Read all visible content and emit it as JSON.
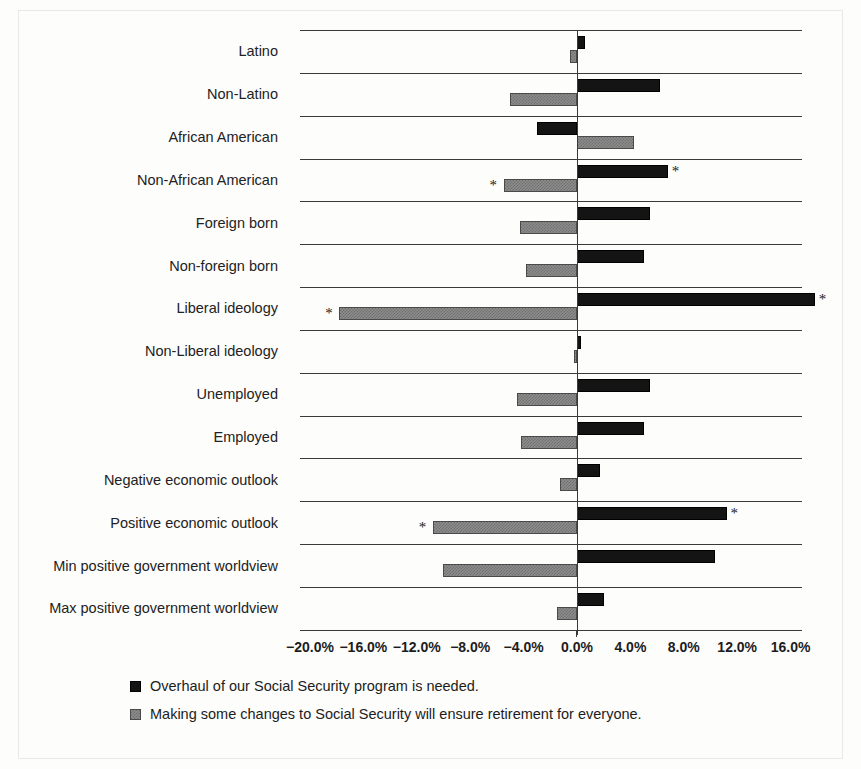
{
  "chart_data": {
    "type": "bar",
    "orientation": "horizontal",
    "title": "",
    "xlabel": "",
    "ylabel": "",
    "xlim": [
      -20.8,
      16.8
    ],
    "grid": true,
    "legend_position": "bottom-left",
    "xticks": [
      "−20.0%",
      "−16.0%",
      "−12.0%",
      "−8.0%",
      "−4.0%",
      "0.0%",
      "4.0%",
      "8.0%",
      "12.0%",
      "16.0%"
    ],
    "xtick_values": [
      -20,
      -16,
      -12,
      -8,
      -4,
      0,
      4,
      8,
      12,
      16
    ],
    "categories": [
      "Latino",
      "Non-Latino",
      "African American",
      "Non-African American",
      "Foreign born",
      "Non-foreign born",
      "Liberal ideology",
      "Non-Liberal ideology",
      "Unemployed",
      "Employed",
      "Negative economic outlook",
      "Positive economic outlook",
      "Min positive government worldview",
      "Max positive government worldview"
    ],
    "series": [
      {
        "name": "Overhaul of our Social Security program is needed.",
        "color": "#141414",
        "values": [
          0.6,
          6.2,
          -3.0,
          6.8,
          5.5,
          5.0,
          17.8,
          0.3,
          5.5,
          5.0,
          1.7,
          11.2,
          10.3,
          2.0
        ],
        "significance": [
          false,
          false,
          false,
          true,
          false,
          false,
          true,
          false,
          false,
          false,
          false,
          true,
          false,
          false
        ]
      },
      {
        "name": "Making some changes to Social Security will ensure retirement for everyone.",
        "color": "#8d8d8d",
        "values": [
          -0.5,
          -5.0,
          4.3,
          -5.5,
          -4.3,
          -3.8,
          -17.8,
          -0.2,
          -4.5,
          -4.2,
          -1.3,
          -10.8,
          -10.0,
          -1.5
        ],
        "significance": [
          false,
          false,
          false,
          true,
          false,
          false,
          true,
          false,
          false,
          false,
          false,
          true,
          false,
          false
        ]
      }
    ],
    "significance_marker": "*"
  },
  "legend": {
    "items": [
      {
        "label": "Overhaul of our Social Security program is needed.",
        "swatch": "black"
      },
      {
        "label": "Making some changes to Social Security will ensure retirement for everyone.",
        "swatch": "gray"
      }
    ]
  }
}
